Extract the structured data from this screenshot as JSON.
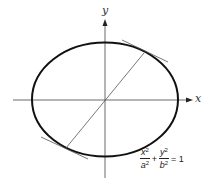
{
  "diagram": {
    "type": "ellipse-conjugate-diameter",
    "axes": {
      "x_label": "x",
      "y_label": "y"
    },
    "equation": {
      "term1": {
        "numerator": "x",
        "numerator_exp": "2",
        "denominator": "a",
        "denominator_exp": "2"
      },
      "plus": "+",
      "term2": {
        "numerator": "y",
        "numerator_exp": "2",
        "denominator": "b",
        "denominator_exp": "2"
      },
      "equals": "= 1"
    },
    "colors": {
      "ellipse": "#111111",
      "axes": "#444444",
      "lines": "#555555",
      "background": "#ffffff"
    }
  }
}
